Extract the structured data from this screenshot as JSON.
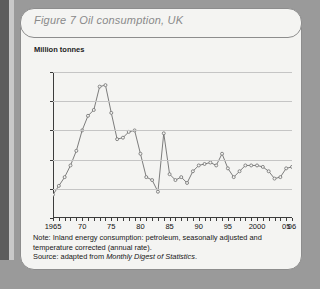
{
  "figure": {
    "title": "Figure 7   Oil consumption, UK",
    "y_axis_label": "Million tonnes",
    "note": "Note: Inland energy consumption: petroleum, seasonally adjusted and temperature corrected (annual rate).",
    "source_prefix": "Source:  adapted from ",
    "source_title": "Monthly Digest of Statistics",
    "source_suffix": "."
  },
  "chart_data": {
    "type": "line",
    "title": "Figure 7   Oil consumption, UK",
    "xlabel": "",
    "ylabel": "Million tonnes",
    "ylim": [
      60,
      110
    ],
    "xlim": [
      1965,
      2006
    ],
    "yticks": [
      60,
      70,
      80,
      90,
      100,
      110
    ],
    "xticks": [
      1965,
      1970,
      1975,
      1980,
      1985,
      1990,
      1995,
      2000,
      2005,
      2006
    ],
    "xtick_labels": [
      "1965",
      "70",
      "75",
      "80",
      "85",
      "90",
      "95",
      "2000",
      "05",
      "06"
    ],
    "grid": true,
    "legend": "none",
    "marker": "open-circle",
    "line_color": "#6e6e6e",
    "series": [
      {
        "name": "Oil consumption, UK",
        "x": [
          1965,
          1966,
          1967,
          1968,
          1969,
          1970,
          1971,
          1972,
          1973,
          1974,
          1975,
          1976,
          1977,
          1978,
          1979,
          1980,
          1981,
          1982,
          1983,
          1984,
          1985,
          1986,
          1987,
          1988,
          1989,
          1990,
          1991,
          1992,
          1993,
          1994,
          1995,
          1996,
          1997,
          1998,
          1999,
          2000,
          2001,
          2002,
          2003,
          2004,
          2005,
          2006
        ],
        "values": [
          68,
          71,
          74,
          78,
          83,
          90,
          95,
          97,
          105,
          105.5,
          96,
          87,
          87.5,
          89.5,
          90,
          82,
          74,
          73,
          69,
          89,
          75,
          73,
          74,
          72,
          76,
          78,
          78.5,
          79,
          78,
          82,
          77,
          74,
          76,
          78,
          78,
          78,
          77.5,
          76,
          73.5,
          74,
          77,
          77.5
        ]
      }
    ]
  }
}
